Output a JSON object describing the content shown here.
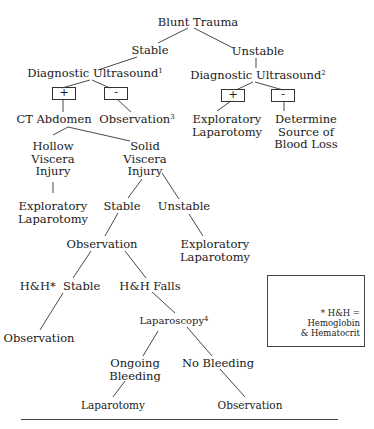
{
  "diagram": {
    "title": "Blunt Trauma",
    "nodes": {
      "root": "Blunt Trauma",
      "stable": "Stable",
      "unstable": "Unstable",
      "us1": "Diagnostic Ultrasound",
      "us1_note": "1",
      "us2": "Diagnostic Ultrasound",
      "us2_note": "2",
      "pos1": "+",
      "neg1": "-",
      "pos2": "+",
      "neg2": "-",
      "ct": "CT Abdomen",
      "obs3": "Observation",
      "obs3_note": "3",
      "explap1_l1": "Exploratory",
      "explap1_l2": "Laparotomy",
      "det_l1": "Determine",
      "det_l2": "Source of",
      "det_l3": "Blood Loss",
      "hollow_l1": "Hollow",
      "hollow_l2": "Viscera",
      "hollow_l3": "Injury",
      "solid_l1": "Solid",
      "solid_l2": "Viscera",
      "solid_l3": "Injury",
      "explap2_l1": "Exploratory",
      "explap2_l2": "Laparotomy",
      "stable2": "Stable",
      "unstable2": "Unstable",
      "observation": "Observation",
      "explap3_l1": "Exploratory",
      "explap3_l2": "Laparotomy",
      "hh_stable": "H&H*  Stable",
      "hh_falls": "H&H Falls",
      "observation2": "Observation",
      "laparoscopy": "Laparoscopy",
      "laparoscopy_note": "4",
      "ongoing_l1": "Ongoing",
      "ongoing_l2": "Bleeding",
      "nobleed": "No Bleeding",
      "laparotomy": "Laparotomy",
      "observation3": "Observation"
    },
    "legend": {
      "line1": "* H&H = Hemoglobin",
      "line2": "& Hematocrit"
    }
  }
}
